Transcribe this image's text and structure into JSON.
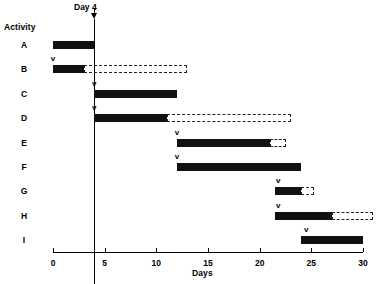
{
  "chart_data": {
    "type": "bar",
    "title": "",
    "subtitle": "",
    "xlabel": "Days",
    "ylabel": "Activity",
    "xlim": [
      0,
      30
    ],
    "xticks": [
      0,
      5,
      10,
      15,
      20,
      25,
      30
    ],
    "xtick_labels": [
      "0",
      "5",
      "10",
      "15",
      "20",
      "25",
      "30"
    ],
    "grid": false,
    "legend": null,
    "categories": [
      "A",
      "B",
      "C",
      "D",
      "E",
      "F",
      "G",
      "H",
      "I"
    ],
    "annotations": [
      {
        "name": "day-marker",
        "label": "Day 4",
        "value": 4
      }
    ],
    "marker_symbol": "v",
    "series": [
      {
        "name": "Scheduled duration (solid)",
        "bars": [
          {
            "activity": "A",
            "start": 0,
            "end": 4
          },
          {
            "activity": "B",
            "start": 0,
            "end": 3
          },
          {
            "activity": "C",
            "start": 4,
            "end": 12
          },
          {
            "activity": "D",
            "start": 4,
            "end": 11
          },
          {
            "activity": "E",
            "start": 12,
            "end": 21
          },
          {
            "activity": "F",
            "start": 12,
            "end": 24
          },
          {
            "activity": "G",
            "start": 21.5,
            "end": 24
          },
          {
            "activity": "H",
            "start": 21.5,
            "end": 27
          },
          {
            "activity": "I",
            "start": 24,
            "end": 30
          }
        ]
      },
      {
        "name": "Float / slack (dashed)",
        "bars": [
          {
            "activity": "B",
            "start": 3,
            "end": 13
          },
          {
            "activity": "D",
            "start": 11,
            "end": 23
          },
          {
            "activity": "E",
            "start": 21,
            "end": 22.5
          },
          {
            "activity": "G",
            "start": 24,
            "end": 25.3
          },
          {
            "activity": "H",
            "start": 27,
            "end": 31
          }
        ]
      },
      {
        "name": "Start markers (v)",
        "points": [
          {
            "activity": "B",
            "x": 0
          },
          {
            "activity": "C",
            "x": 4
          },
          {
            "activity": "D",
            "x": 4
          },
          {
            "activity": "E",
            "x": 12
          },
          {
            "activity": "F",
            "x": 12
          },
          {
            "activity": "G",
            "x": 21.8
          },
          {
            "activity": "H",
            "x": 21.8
          },
          {
            "activity": "I",
            "x": 24.5
          }
        ]
      }
    ]
  },
  "labels": {
    "activity_axis_title": "Activity",
    "days_axis_title": "Days",
    "day_marker_label": "Day 4"
  }
}
